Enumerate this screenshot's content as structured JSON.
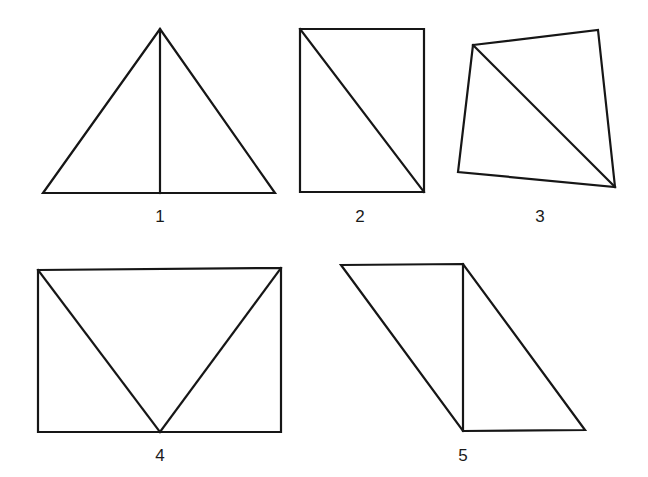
{
  "page": {
    "background_color": "#ffffff",
    "stroke_color": "#161616",
    "width": 648,
    "height": 477
  },
  "chart_data": {
    "type": "diagram",
    "title": "",
    "figures": [
      {
        "label": "1",
        "shape": "triangle",
        "outline": [
          [
            43,
            193
          ],
          [
            160,
            29
          ],
          [
            275,
            193
          ]
        ],
        "inner_lines": [
          [
            [
              160,
              29
            ],
            [
              160,
              193
            ]
          ]
        ],
        "label_pos": [
          160,
          216
        ],
        "parts": 2
      },
      {
        "label": "2",
        "shape": "rectangle",
        "outline": [
          [
            300,
            29
          ],
          [
            424,
            29
          ],
          [
            424,
            192
          ],
          [
            300,
            192
          ]
        ],
        "inner_lines": [
          [
            [
              300,
              29
            ],
            [
              424,
              192
            ]
          ]
        ],
        "label_pos": [
          360,
          216
        ],
        "parts": 2
      },
      {
        "label": "3",
        "shape": "quadrilateral",
        "outline": [
          [
            473,
            45
          ],
          [
            598,
            30
          ],
          [
            615,
            187
          ],
          [
            458,
            172
          ]
        ],
        "inner_lines": [
          [
            [
              473,
              45
            ],
            [
              615,
              187
            ]
          ]
        ],
        "label_pos": [
          540,
          216
        ],
        "parts": 2
      },
      {
        "label": "4",
        "shape": "rectangle-with-v",
        "outline": [
          [
            38,
            270
          ],
          [
            38,
            432
          ],
          [
            281,
            432
          ],
          [
            281,
            268
          ]
        ],
        "inner_lines": [
          [
            [
              38,
              270
            ],
            [
              160,
              432
            ]
          ],
          [
            [
              160,
              432
            ],
            [
              281,
              268
            ]
          ]
        ],
        "label_pos": [
          160,
          455
        ],
        "parts": 2
      },
      {
        "label": "5",
        "shape": "parallelogram",
        "outline": [
          [
            341,
            265
          ],
          [
            463,
            264
          ],
          [
            585,
            430
          ],
          [
            463,
            431
          ]
        ],
        "inner_lines": [
          [
            [
              463,
              264
            ],
            [
              463,
              431
            ]
          ]
        ],
        "label_pos": [
          463,
          455
        ],
        "parts": 2
      }
    ]
  }
}
